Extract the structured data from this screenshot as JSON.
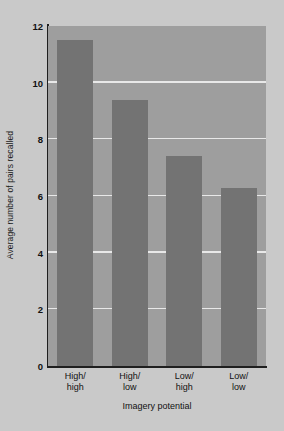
{
  "chart_data": {
    "type": "bar",
    "title": "",
    "categories": [
      "High/\nhigh",
      "High/\nlow",
      "Low/\nhigh",
      "Low/\nlow"
    ],
    "category_lines": [
      [
        "High/",
        "high"
      ],
      [
        "High/",
        "low"
      ],
      [
        "Low/",
        "high"
      ],
      [
        "Low/",
        "low"
      ]
    ],
    "values": [
      11.5,
      9.4,
      7.4,
      6.3
    ],
    "xlabel": "Imagery potential",
    "ylabel": "Average number of pairs recalled",
    "ylim": [
      0,
      12
    ],
    "yticks": [
      0,
      2,
      4,
      6,
      8,
      10,
      12
    ],
    "ytick_labels": [
      "0",
      "2",
      "4",
      "6",
      "8",
      "10",
      "12"
    ],
    "grid": "horizontal",
    "legend": "none",
    "colors": {
      "bar": "#737373",
      "plot_background": "#9e9e9e",
      "figure_background": "#c9c9c9",
      "gridline": "#e8e8e8",
      "axis": "#1f1f1f",
      "text": "#111111"
    }
  }
}
